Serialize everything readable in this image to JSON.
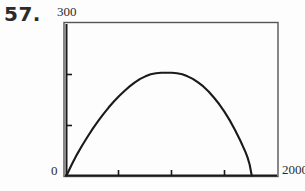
{
  "figure": {
    "problem_number": "57.",
    "axes": {
      "y_max_label": "300",
      "y_min_label": "0",
      "x_max_label": "2000",
      "x_min_label": ""
    }
  },
  "colors": {
    "ink": "#1a1a1a",
    "frame": "#555555",
    "label": "#2a2a2a",
    "number": "#2b2b2b",
    "background": "#fdfdfd"
  },
  "chart_data": {
    "type": "line",
    "title": "",
    "xlabel": "",
    "ylabel": "",
    "xlim": [
      0,
      2000
    ],
    "ylim": [
      0,
      300
    ],
    "grid": false,
    "legend": null,
    "x_ticks": [
      0,
      500,
      1000,
      1500,
      2000
    ],
    "x_tick_labels": [
      "0",
      "",
      "",
      "",
      "2000"
    ],
    "y_ticks": [
      0,
      100,
      200,
      300
    ],
    "y_tick_labels": [
      "0",
      "",
      "",
      "300"
    ],
    "series": [
      {
        "name": "curve",
        "x": [
          0,
          50,
          100,
          150,
          200,
          250,
          300,
          350,
          400,
          450,
          500,
          550,
          600,
          650,
          700,
          750,
          800,
          850,
          900,
          950,
          1000,
          1050,
          1100,
          1150,
          1200,
          1250,
          1300,
          1350,
          1400,
          1450,
          1500,
          1550,
          1600,
          1650,
          1700,
          1720,
          1740,
          1760
        ],
        "y": [
          0,
          22,
          42,
          60,
          77,
          93,
          108,
          122,
          135,
          147,
          158,
          168,
          177,
          185,
          192,
          197,
          201,
          203,
          204,
          204,
          204,
          203,
          201,
          197,
          192,
          185,
          177,
          167,
          155,
          142,
          127,
          110,
          91,
          70,
          47,
          36,
          22,
          0
        ]
      }
    ]
  }
}
